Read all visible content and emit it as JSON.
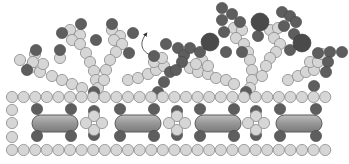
{
  "diagram": {
    "colors": {
      "light_bead": "#d6d6d6",
      "dark_bead": "#5e5e5e",
      "large_dark_bead": "#4a4a4a",
      "rod": "#9a9a9a",
      "outline": "#8a8a8a"
    },
    "lattice": {
      "top_row_y": 97,
      "bottom_row_y": 150,
      "bead_radius": 5.6,
      "spacing": 11.6,
      "x_start": 12,
      "count": 28,
      "left_column": [
        {
          "x": 12,
          "y": 110
        },
        {
          "x": 12,
          "y": 123
        },
        {
          "x": 12,
          "y": 137
        }
      ]
    },
    "rods": [
      {
        "x": 32,
        "y": 115,
        "w": 46,
        "h": 17
      },
      {
        "x": 115,
        "y": 115,
        "w": 46,
        "h": 17
      },
      {
        "x": 195,
        "y": 115,
        "w": 46,
        "h": 17
      },
      {
        "x": 276,
        "y": 115,
        "w": 46,
        "h": 17
      }
    ],
    "rod_end_beads": [
      {
        "x": 37,
        "y": 109
      },
      {
        "x": 71,
        "y": 109
      },
      {
        "x": 37,
        "y": 136
      },
      {
        "x": 71,
        "y": 136
      },
      {
        "x": 120,
        "y": 109
      },
      {
        "x": 154,
        "y": 109
      },
      {
        "x": 120,
        "y": 136
      },
      {
        "x": 154,
        "y": 136
      },
      {
        "x": 200,
        "y": 109
      },
      {
        "x": 234,
        "y": 109
      },
      {
        "x": 200,
        "y": 136
      },
      {
        "x": 234,
        "y": 136
      },
      {
        "x": 280,
        "y": 109
      },
      {
        "x": 316,
        "y": 109
      },
      {
        "x": 280,
        "y": 136
      },
      {
        "x": 316,
        "y": 136
      }
    ],
    "cross_groups": [
      {
        "cx": 94,
        "cy": 123
      },
      {
        "cx": 177,
        "cy": 123
      },
      {
        "cx": 256,
        "cy": 123
      }
    ],
    "light_beads": [
      [
        20,
        60
      ],
      [
        30,
        68
      ],
      [
        40,
        72
      ],
      [
        52,
        76
      ],
      [
        62,
        80
      ],
      [
        72,
        84
      ],
      [
        82,
        88
      ],
      [
        35,
        54
      ],
      [
        43,
        64
      ],
      [
        33,
        62
      ],
      [
        70,
        30
      ],
      [
        80,
        35
      ],
      [
        72,
        40
      ],
      [
        80,
        44
      ],
      [
        86,
        53
      ],
      [
        90,
        62
      ],
      [
        94,
        71
      ],
      [
        96,
        80
      ],
      [
        98,
        88
      ],
      [
        112,
        30
      ],
      [
        120,
        36
      ],
      [
        114,
        40
      ],
      [
        122,
        44
      ],
      [
        116,
        52
      ],
      [
        110,
        60
      ],
      [
        106,
        70
      ],
      [
        104,
        80
      ],
      [
        128,
        80
      ],
      [
        138,
        78
      ],
      [
        148,
        74
      ],
      [
        156,
        70
      ],
      [
        164,
        66
      ],
      [
        154,
        62
      ],
      [
        162,
        58
      ],
      [
        60,
        58
      ],
      [
        190,
        68
      ],
      [
        198,
        72
      ],
      [
        208,
        74
      ],
      [
        216,
        78
      ],
      [
        226,
        80
      ],
      [
        234,
        84
      ],
      [
        202,
        60
      ],
      [
        208,
        66
      ],
      [
        196,
        64
      ],
      [
        234,
        28
      ],
      [
        242,
        30
      ],
      [
        236,
        38
      ],
      [
        244,
        44
      ],
      [
        248,
        52
      ],
      [
        250,
        60
      ],
      [
        252,
        70
      ],
      [
        252,
        80
      ],
      [
        250,
        88
      ],
      [
        270,
        30
      ],
      [
        278,
        28
      ],
      [
        274,
        38
      ],
      [
        280,
        44
      ],
      [
        276,
        52
      ],
      [
        270,
        58
      ],
      [
        266,
        66
      ],
      [
        262,
        76
      ],
      [
        288,
        80
      ],
      [
        298,
        76
      ],
      [
        306,
        72
      ],
      [
        314,
        70
      ],
      [
        310,
        62
      ],
      [
        318,
        62
      ],
      [
        322,
        54
      ]
    ],
    "dark_beads": [
      [
        36,
        50
      ],
      [
        27,
        70
      ],
      [
        60,
        50
      ],
      [
        62,
        33
      ],
      [
        81,
        24
      ],
      [
        96,
        40
      ],
      [
        112,
        24
      ],
      [
        133,
        33
      ],
      [
        129,
        53
      ],
      [
        154,
        56
      ],
      [
        166,
        44
      ],
      [
        170,
        72
      ],
      [
        164,
        82
      ],
      [
        178,
        48
      ],
      [
        184,
        55
      ],
      [
        190,
        48
      ],
      [
        182,
        62
      ],
      [
        176,
        70
      ],
      [
        222,
        8
      ],
      [
        232,
        14
      ],
      [
        222,
        20
      ],
      [
        224,
        32
      ],
      [
        240,
        22
      ],
      [
        258,
        36
      ],
      [
        226,
        52
      ],
      [
        242,
        52
      ],
      [
        282,
        12
      ],
      [
        290,
        16
      ],
      [
        284,
        26
      ],
      [
        296,
        22
      ],
      [
        294,
        34
      ],
      [
        290,
        50
      ],
      [
        318,
        53
      ],
      [
        330,
        52
      ],
      [
        342,
        52
      ],
      [
        328,
        62
      ],
      [
        326,
        72
      ],
      [
        314,
        86
      ],
      [
        200,
        52
      ],
      [
        158,
        92
      ],
      [
        246,
        92
      ],
      [
        94,
        92
      ]
    ],
    "large_dark_beads": [
      [
        210,
        42
      ],
      [
        260,
        22
      ],
      [
        302,
        43
      ]
    ],
    "arrow": {
      "path": "M150 55 C140 50 140 42 146 34",
      "head": [
        146,
        32
      ]
    }
  }
}
